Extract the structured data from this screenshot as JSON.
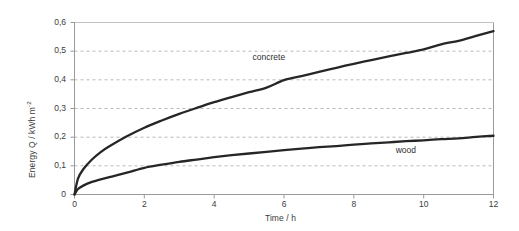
{
  "chart_data": {
    "type": "line",
    "title": "",
    "xlabel": "Time / h",
    "ylabel_text": "Energy Q / kWh m",
    "ylabel_exponent": "-2",
    "xlim": [
      0,
      12
    ],
    "ylim": [
      0,
      0.6
    ],
    "xticks": [
      "0",
      "2",
      "4",
      "6",
      "8",
      "10",
      "12"
    ],
    "xtick_values": [
      0,
      2,
      4,
      6,
      8,
      10,
      12
    ],
    "yticks": [
      "0",
      "0,1",
      "0,2",
      "0,3",
      "0,4",
      "0,5",
      "0,6"
    ],
    "ytick_values": [
      0,
      0.1,
      0.2,
      0.3,
      0.4,
      0.5,
      0.6
    ],
    "grid": "horizontal-dashed",
    "legend_position": "inline-annotations",
    "decimal_separator": ",",
    "x": [
      0,
      0.1,
      0.25,
      0.5,
      0.75,
      1,
      1.5,
      2,
      2.5,
      3,
      3.5,
      4,
      4.5,
      5,
      5.5,
      6,
      6.5,
      7,
      7.5,
      8,
      8.5,
      9,
      9.5,
      10,
      10.5,
      11,
      11.5,
      12
    ],
    "series": [
      {
        "name": "concrete",
        "label": "concrete",
        "color": "#262626",
        "values": [
          0,
          0.055,
          0.088,
          0.122,
          0.148,
          0.168,
          0.203,
          0.233,
          0.258,
          0.281,
          0.302,
          0.322,
          0.34,
          0.357,
          0.373,
          0.399,
          0.413,
          0.428,
          0.442,
          0.456,
          0.469,
          0.482,
          0.494,
          0.506,
          0.524,
          0.536,
          0.553,
          0.57
        ]
      },
      {
        "name": "wood",
        "label": "wood",
        "color": "#262626",
        "values": [
          0,
          0.019,
          0.031,
          0.044,
          0.053,
          0.061,
          0.076,
          0.093,
          0.104,
          0.114,
          0.122,
          0.13,
          0.137,
          0.143,
          0.149,
          0.155,
          0.16,
          0.165,
          0.169,
          0.174,
          0.178,
          0.182,
          0.186,
          0.189,
          0.193,
          0.196,
          0.201,
          0.205
        ]
      }
    ],
    "annotations": [
      {
        "text": "concrete",
        "x": 5.1,
        "y": 0.475
      },
      {
        "text": "wood",
        "x": 9.2,
        "y": 0.152
      }
    ],
    "colors": {
      "curve": "#262626",
      "grid": "#b9b9b9",
      "axis": "#9a9a9a",
      "text": "#3b3b3b",
      "background": "#ffffff"
    }
  }
}
